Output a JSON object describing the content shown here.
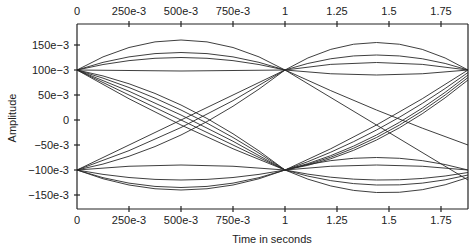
{
  "chart_data": {
    "type": "line",
    "subtype": "eye-diagram",
    "title": "",
    "xlabel": "Time in seconds",
    "ylabel": "Amplitude",
    "xlim": [
      0,
      1.88
    ],
    "ylim": [
      -0.18,
      0.18
    ],
    "x_ticks": [
      0,
      0.25,
      0.5,
      0.75,
      1,
      1.25,
      1.5,
      1.75
    ],
    "x_tick_labels": [
      "0",
      "250e-3",
      "500e-3",
      "750e-3",
      "1",
      "1.25",
      "1.5",
      "1.75"
    ],
    "y_ticks": [
      0.15,
      0.1,
      0.05,
      0,
      -0.05,
      -0.1,
      -0.15
    ],
    "y_tick_labels": [
      "150e-3",
      "100e-3",
      "50e-3",
      "0",
      "-50e-3",
      "-100e-3",
      "-150e-3"
    ],
    "grid": false,
    "legend": null,
    "top_axis_mirrored": true,
    "series": [
      {
        "name": "high-stay-arc-1",
        "segment": [
          0,
          1
        ],
        "y0": 0.1,
        "y1": 0.1,
        "peak": 0.16
      },
      {
        "name": "high-stay-arc-2",
        "segment": [
          0,
          1
        ],
        "y0": 0.1,
        "y1": 0.1,
        "peak": 0.135
      },
      {
        "name": "high-stay-arc-3",
        "segment": [
          0,
          1
        ],
        "y0": 0.1,
        "y1": 0.1,
        "peak": 0.125
      },
      {
        "name": "high-stay-flat",
        "segment": [
          0,
          1
        ],
        "y0": 0.1,
        "y1": 0.1,
        "peak": 0.098
      },
      {
        "name": "high-to-low-1",
        "segment": [
          0,
          1
        ],
        "y0": 0.1,
        "y1": -0.1,
        "peak": 0
      },
      {
        "name": "high-to-low-2",
        "segment": [
          0,
          1
        ],
        "y0": 0.1,
        "y1": -0.1,
        "peak": 0.01
      },
      {
        "name": "high-to-low-3",
        "segment": [
          0,
          1
        ],
        "y0": 0.1,
        "y1": -0.1,
        "peak": 0.02
      },
      {
        "name": "high-to-low-4",
        "segment": [
          0,
          1
        ],
        "y0": 0.1,
        "y1": -0.1,
        "peak": 0.03
      },
      {
        "name": "high-to-low-5",
        "segment": [
          0,
          1
        ],
        "y0": 0.1,
        "y1": -0.1,
        "peak": -0.01
      },
      {
        "name": "low-to-high-1",
        "segment": [
          0,
          1
        ],
        "y0": -0.1,
        "y1": 0.1,
        "peak": 0
      },
      {
        "name": "low-to-high-2",
        "segment": [
          0,
          1
        ],
        "y0": -0.1,
        "y1": 0.1,
        "peak": -0.015
      },
      {
        "name": "low-to-high-3",
        "segment": [
          0,
          1
        ],
        "y0": -0.1,
        "y1": 0.1,
        "peak": -0.03
      },
      {
        "name": "low-stay-flat",
        "segment": [
          0,
          1
        ],
        "y0": -0.1,
        "y1": -0.1,
        "peak": -0.09
      },
      {
        "name": "low-stay-arc-1",
        "segment": [
          0,
          1
        ],
        "y0": -0.1,
        "y1": -0.1,
        "peak": -0.12
      },
      {
        "name": "low-stay-arc-2",
        "segment": [
          0,
          1
        ],
        "y0": -0.1,
        "y1": -0.1,
        "peak": -0.135
      },
      {
        "name": "low-stay-arc-3",
        "segment": [
          0,
          1
        ],
        "y0": -0.1,
        "y1": -0.1,
        "peak": -0.14
      },
      {
        "name": "high-stay-arc-4",
        "segment": [
          1,
          1.88
        ],
        "y0": 0.1,
        "y1": 0.1,
        "peak": 0.155
      },
      {
        "name": "high-stay-arc-5",
        "segment": [
          1,
          1.88
        ],
        "y0": 0.1,
        "y1": 0.1,
        "peak": 0.13
      },
      {
        "name": "high-stay-arc-6",
        "segment": [
          1,
          1.88
        ],
        "y0": 0.1,
        "y1": 0.1,
        "peak": 0.115
      },
      {
        "name": "high-stay-dip",
        "segment": [
          1,
          1.88
        ],
        "y0": 0.1,
        "y1": 0.1,
        "peak": 0.09
      },
      {
        "name": "high-to-low-6",
        "segment": [
          1,
          1.88
        ],
        "y0": 0.1,
        "y1": -0.12,
        "peak": -0.01
      },
      {
        "name": "high-to-low-7",
        "segment": [
          1,
          1.88
        ],
        "y0": 0.1,
        "y1": -0.05,
        "peak": 0.02
      },
      {
        "name": "low-to-high-4",
        "segment": [
          1,
          1.88
        ],
        "y0": -0.1,
        "y1": 0.1,
        "peak": -0.01
      },
      {
        "name": "low-to-high-5",
        "segment": [
          1,
          1.88
        ],
        "y0": -0.1,
        "y1": 0.095,
        "peak": -0.02
      },
      {
        "name": "low-to-high-6",
        "segment": [
          1,
          1.88
        ],
        "y0": -0.1,
        "y1": 0.09,
        "peak": -0.03
      },
      {
        "name": "low-to-high-7",
        "segment": [
          1,
          1.88
        ],
        "y0": -0.1,
        "y1": 0.085,
        "peak": -0.035
      },
      {
        "name": "low-to-high-8",
        "segment": [
          1,
          1.88
        ],
        "y0": -0.1,
        "y1": 0.08,
        "peak": -0.04
      },
      {
        "name": "low-stay-flat-2",
        "segment": [
          1,
          1.88
        ],
        "y0": -0.1,
        "y1": -0.1,
        "peak": -0.075
      },
      {
        "name": "low-stay-flat-3",
        "segment": [
          1,
          1.88
        ],
        "y0": -0.1,
        "y1": -0.1,
        "peak": -0.09
      },
      {
        "name": "low-stay-arc-4",
        "segment": [
          1,
          1.88
        ],
        "y0": -0.1,
        "y1": -0.105,
        "peak": -0.12
      },
      {
        "name": "low-stay-arc-5",
        "segment": [
          1,
          1.88
        ],
        "y0": -0.1,
        "y1": -0.11,
        "peak": -0.13
      },
      {
        "name": "low-stay-arc-6",
        "segment": [
          1,
          1.88
        ],
        "y0": -0.1,
        "y1": -0.115,
        "peak": -0.145
      }
    ]
  }
}
